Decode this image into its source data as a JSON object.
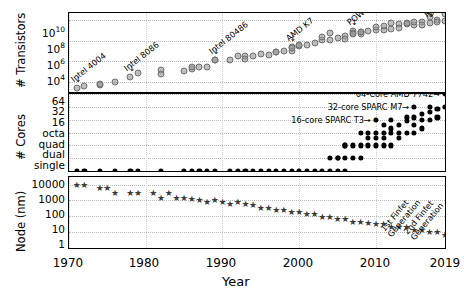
{
  "figure": {
    "xlabel": "Year",
    "xticks": [
      "1970",
      "1980",
      "1990",
      "2000",
      "2010",
      "2019"
    ],
    "xlim": [
      1970,
      2019
    ]
  },
  "panels": {
    "transistors": {
      "ylabel": "# Transistors",
      "yticks": [
        "10",
        "10",
        "10",
        "10"
      ],
      "yexp": [
        "10",
        "8",
        "6",
        "4"
      ]
    },
    "cores": {
      "ylabel": "# Cores",
      "yticks": [
        "64",
        "32",
        "16",
        "octa",
        "quad",
        "dual",
        "single"
      ]
    },
    "node": {
      "ylabel": "Node (nm)",
      "yticks": [
        "10000",
        "1000",
        "100",
        "10",
        "1"
      ]
    }
  },
  "annotations": {
    "transistors": [
      {
        "text": "Intel 4004",
        "year": 1971,
        "value": 2300
      },
      {
        "text": "Intel 8086",
        "year": 1978,
        "value": 29000
      },
      {
        "text": "Intel 80486",
        "year": 1989,
        "value": 1180235
      },
      {
        "text": "AMD K7",
        "year": 1999,
        "value": 22000000
      },
      {
        "text": "POWER6",
        "year": 2007,
        "value": 790000000
      },
      {
        "text": "Ryzen",
        "year": 2017,
        "value": 4800000000
      }
    ],
    "cores": [
      {
        "text": "64-Core AMD 7742",
        "year": 2019,
        "value": 64
      },
      {
        "text": "32-core SPARC M7",
        "year": 2015,
        "value": 32
      },
      {
        "text": "16-core SPARC T3",
        "year": 2010,
        "value": 16
      }
    ],
    "node": [
      {
        "text": "1st Finfet Generation",
        "year": 2012,
        "value": 22
      },
      {
        "text": "2nd Finfet Generation",
        "year": 2015,
        "value": 14
      }
    ]
  },
  "chart_data": {
    "type": "scatter",
    "title": "",
    "xlabel": "Year",
    "xlim": [
      1970,
      2019
    ],
    "grid": true,
    "legend": "none",
    "subplots": [
      {
        "name": "transistors",
        "ylabel": "# Transistors",
        "yscale": "log",
        "ylim": [
          1000,
          50000000000
        ],
        "yticks": [
          10000,
          1000000,
          100000000,
          10000000000
        ],
        "ytick_labels": [
          "10^4",
          "10^6",
          "10^8",
          "10^10"
        ],
        "marker": "circle-gray",
        "x": [
          1971,
          1972,
          1974,
          1974,
          1976,
          1978,
          1979,
          1982,
          1982,
          1985,
          1986,
          1986,
          1987,
          1988,
          1989,
          1989,
          1991,
          1992,
          1993,
          1993,
          1994,
          1995,
          1996,
          1997,
          1997,
          1998,
          1999,
          1999,
          1999,
          2000,
          2000,
          2001,
          2002,
          2003,
          2003,
          2004,
          2004,
          2005,
          2006,
          2006,
          2007,
          2007,
          2007,
          2008,
          2008,
          2008,
          2009,
          2010,
          2010,
          2011,
          2011,
          2012,
          2012,
          2013,
          2013,
          2014,
          2014,
          2015,
          2015,
          2016,
          2016,
          2017,
          2017,
          2018,
          2018,
          2019,
          2019
        ],
        "y": [
          2300,
          3500,
          4500,
          6000,
          8500,
          29000,
          68000,
          134000,
          55000,
          105000,
          190000,
          273000,
          275000,
          250000,
          1180235,
          1200000,
          1180000,
          3100000,
          3100000,
          1600000,
          3300000,
          5500000,
          4300000,
          7500000,
          8800000,
          9500000,
          22000000,
          9500000,
          21000000,
          28000000,
          37500000,
          42000000,
          55000000,
          105900000,
          220000000,
          112000000,
          592000000,
          169000000,
          291000000,
          151000000,
          790000000,
          582000000,
          463000000,
          731000000,
          411000000,
          758000000,
          904000000,
          1170000000,
          2300000000,
          1200000000,
          2600000000,
          1400000000,
          5000000000,
          4310000000,
          1860000000,
          4200000000,
          5560000000,
          3200000000,
          7100000000,
          7200000000,
          3300000000,
          4800000000,
          19200000000,
          9700000000,
          6900000000,
          39540000000,
          8000000000
        ]
      },
      {
        "name": "cores",
        "ylabel": "# Cores",
        "yscale": "log2",
        "ylim": [
          1,
          64
        ],
        "yticks": [
          1,
          2,
          4,
          8,
          16,
          32,
          64
        ],
        "ytick_labels": [
          "single",
          "dual",
          "quad",
          "octa",
          "16",
          "32",
          "64"
        ],
        "marker": "circle-black",
        "x": [
          1971,
          1972,
          1974,
          1976,
          1978,
          1979,
          1982,
          1985,
          1986,
          1987,
          1988,
          1989,
          1991,
          1992,
          1993,
          1994,
          1995,
          1996,
          1997,
          1998,
          1999,
          2000,
          2001,
          2002,
          2003,
          2004,
          2004,
          2005,
          2005,
          2005,
          2006,
          2006,
          2006,
          2006,
          2007,
          2007,
          2008,
          2008,
          2008,
          2009,
          2009,
          2009,
          2010,
          2010,
          2010,
          2010,
          2011,
          2011,
          2011,
          2011,
          2012,
          2012,
          2012,
          2012,
          2013,
          2013,
          2013,
          2014,
          2014,
          2014,
          2015,
          2015,
          2015,
          2015,
          2016,
          2016,
          2016,
          2017,
          2017,
          2017,
          2018,
          2018,
          2019,
          2019
        ],
        "y": [
          1,
          1,
          1,
          1,
          1,
          1,
          1,
          1,
          1,
          1,
          1,
          1,
          1,
          1,
          1,
          1,
          1,
          1,
          1,
          1,
          1,
          1,
          1,
          1,
          1,
          1,
          2,
          1,
          2,
          2,
          1,
          2,
          4,
          4,
          2,
          4,
          2,
          4,
          8,
          4,
          6,
          8,
          4,
          6,
          8,
          16,
          4,
          6,
          8,
          12,
          4,
          8,
          10,
          16,
          6,
          8,
          12,
          8,
          15,
          18,
          8,
          12,
          18,
          32,
          10,
          16,
          22,
          16,
          24,
          32,
          18,
          28,
          32,
          64
        ]
      },
      {
        "name": "node",
        "ylabel": "Node (nm)",
        "yscale": "log",
        "ylim": [
          1,
          30000
        ],
        "yticks": [
          1,
          10,
          100,
          1000,
          10000
        ],
        "ytick_labels": [
          "1",
          "10",
          "100",
          "1000",
          "10000"
        ],
        "marker": "star",
        "x": [
          1971,
          1972,
          1974,
          1975,
          1976,
          1978,
          1979,
          1981,
          1982,
          1983,
          1984,
          1985,
          1986,
          1987,
          1988,
          1989,
          1990,
          1991,
          1992,
          1993,
          1994,
          1995,
          1996,
          1997,
          1998,
          1999,
          2000,
          2001,
          2002,
          2003,
          2004,
          2005,
          2006,
          2007,
          2008,
          2009,
          2010,
          2011,
          2012,
          2013,
          2014,
          2015,
          2016,
          2017,
          2018,
          2019
        ],
        "y": [
          10000,
          10000,
          6000,
          6000,
          3000,
          3000,
          3000,
          3000,
          1500,
          3000,
          1500,
          1500,
          1200,
          1000,
          800,
          1000,
          800,
          600,
          800,
          600,
          500,
          350,
          350,
          250,
          250,
          180,
          180,
          130,
          130,
          90,
          90,
          65,
          65,
          45,
          45,
          40,
          32,
          32,
          22,
          22,
          22,
          14,
          14,
          10,
          10,
          7
        ]
      }
    ]
  }
}
